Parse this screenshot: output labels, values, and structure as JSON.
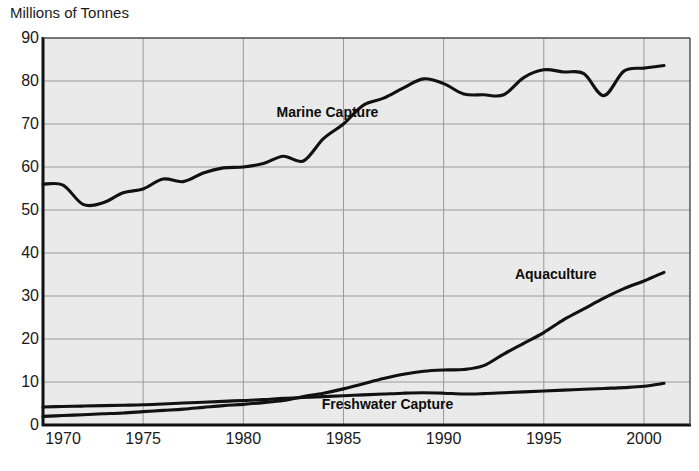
{
  "chart_data": {
    "type": "line",
    "title": "",
    "ylabel": "Millions of Tonnes",
    "xlabel": "",
    "ylim": [
      0,
      90
    ],
    "xlim": [
      1970,
      2002.3
    ],
    "yticks": [
      0,
      10,
      20,
      30,
      40,
      50,
      60,
      70,
      80,
      90
    ],
    "xticks": [
      1970,
      1975,
      1980,
      1985,
      1990,
      1995,
      2000
    ],
    "grid": true,
    "legend_position": "inline-annotations",
    "series": [
      {
        "name": "Marine Capture",
        "color": "#111111",
        "label_x": 1984.2,
        "label_y": 72.5,
        "x": [
          1970,
          1971,
          1972,
          1973,
          1974,
          1975,
          1976,
          1977,
          1978,
          1979,
          1980,
          1981,
          1982,
          1983,
          1984,
          1985,
          1986,
          1987,
          1988,
          1989,
          1990,
          1991,
          1992,
          1993,
          1994,
          1995,
          1996,
          1997,
          1998,
          1999,
          2000,
          2001
        ],
        "values": [
          56.0,
          55.8,
          51.3,
          51.7,
          54.0,
          54.9,
          57.2,
          56.6,
          58.6,
          59.8,
          60.0,
          60.8,
          62.5,
          61.4,
          66.6,
          70.0,
          74.4,
          76.0,
          78.4,
          80.5,
          79.4,
          77.0,
          76.8,
          76.8,
          80.8,
          82.6,
          82.1,
          81.7,
          76.6,
          82.3,
          83.0,
          83.6
        ]
      },
      {
        "name": "Aquaculture",
        "color": "#111111",
        "label_x": 1995.6,
        "label_y": 35.0,
        "x": [
          1970,
          1971,
          1972,
          1973,
          1974,
          1975,
          1976,
          1977,
          1978,
          1979,
          1980,
          1981,
          1982,
          1983,
          1984,
          1985,
          1986,
          1987,
          1988,
          1989,
          1990,
          1991,
          1992,
          1993,
          1994,
          1995,
          1996,
          1997,
          1998,
          1999,
          2000,
          2001
        ],
        "values": [
          2.0,
          2.2,
          2.4,
          2.6,
          2.8,
          3.1,
          3.4,
          3.7,
          4.1,
          4.5,
          4.8,
          5.2,
          5.7,
          6.6,
          7.4,
          8.4,
          9.6,
          10.8,
          11.8,
          12.5,
          12.8,
          12.9,
          13.8,
          16.5,
          19.0,
          21.5,
          24.5,
          27.0,
          29.5,
          31.7,
          33.5,
          35.5
        ]
      },
      {
        "name": "Freshwater Capture",
        "color": "#111111",
        "label_x": 1987.2,
        "label_y": 4.6,
        "x": [
          1970,
          1971,
          1972,
          1973,
          1974,
          1975,
          1976,
          1977,
          1978,
          1979,
          1980,
          1981,
          1982,
          1983,
          1984,
          1985,
          1986,
          1987,
          1988,
          1989,
          1990,
          1991,
          1992,
          1993,
          1994,
          1995,
          1996,
          1997,
          1998,
          1999,
          2000,
          2001
        ],
        "values": [
          4.2,
          4.3,
          4.4,
          4.5,
          4.6,
          4.7,
          4.9,
          5.1,
          5.3,
          5.5,
          5.7,
          5.9,
          6.2,
          6.4,
          6.6,
          6.8,
          7.0,
          7.2,
          7.4,
          7.5,
          7.4,
          7.2,
          7.3,
          7.5,
          7.7,
          7.9,
          8.1,
          8.3,
          8.5,
          8.7,
          9.0,
          9.7
        ]
      }
    ]
  },
  "style": {
    "plot_bg": "#eaeaea",
    "grid_color": "#9a9a9a",
    "axis_color": "#111111",
    "line_color": "#111111",
    "text_color": "#1a1a1a"
  },
  "ytick_labels": [
    "0",
    "10",
    "20",
    "30",
    "40",
    "50",
    "60",
    "70",
    "80",
    "90"
  ],
  "xtick_labels": [
    "1970",
    "1975",
    "1980",
    "1985",
    "1990",
    "1995",
    "2000"
  ],
  "labels": {
    "y_axis_title": "Millions of Tonnes",
    "marine": "Marine Capture",
    "aquaculture": "Aquaculture",
    "freshwater": "Freshwater Capture"
  }
}
